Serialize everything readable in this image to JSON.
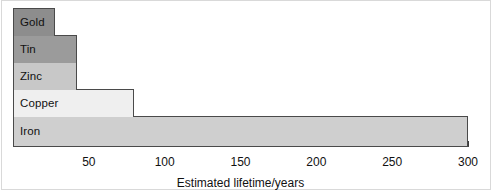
{
  "chart_data": {
    "type": "bar",
    "orientation": "horizontal",
    "title": "",
    "xlabel": "Estimated lifetime/years",
    "ylabel": "",
    "categories": [
      "Gold",
      "Tin",
      "Zinc",
      "Copper",
      "Iron"
    ],
    "values": [
      28,
      42,
      42,
      80,
      300
    ],
    "xlim": [
      0,
      300
    ],
    "xticks": [
      0,
      10,
      20,
      30,
      40,
      50,
      60,
      70,
      80,
      90,
      100,
      110,
      120,
      130,
      140,
      150,
      160,
      170,
      180,
      190,
      200,
      210,
      220,
      230,
      240,
      250,
      260,
      270,
      280,
      290,
      300
    ],
    "xtick_labels": [
      {
        "value": 50,
        "text": "50"
      },
      {
        "value": 100,
        "text": "100"
      },
      {
        "value": 150,
        "text": "150"
      },
      {
        "value": 200,
        "text": "200"
      },
      {
        "value": 250,
        "text": "250"
      },
      {
        "value": 300,
        "text": "300"
      }
    ],
    "tick_interval": 10,
    "label_interval": 50,
    "grid": false,
    "legend": false,
    "bar_colors": [
      "#8d8d8d",
      "#9b9b9b",
      "#c8c8c8",
      "#efefef",
      "#cfcfcf"
    ],
    "bar_border_color": "#4a4a4a",
    "text_color": "#111111",
    "background": "#ffffff"
  }
}
